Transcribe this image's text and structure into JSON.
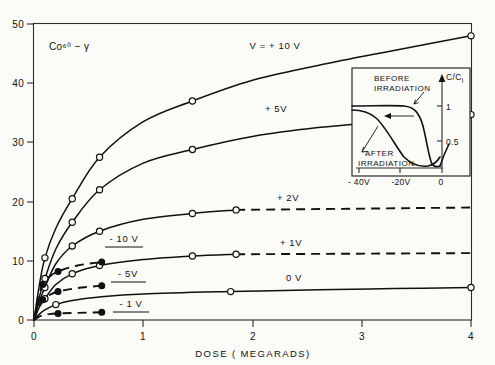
{
  "figure": {
    "sample_label": "Co⁶⁰ − γ",
    "background": "#fbfbf8",
    "ink": "#111111"
  },
  "chart_data": {
    "type": "line",
    "title": "",
    "subtitle": "",
    "annotation_sample": "Co⁶⁰ − γ",
    "xlabel": "DOSE ( MEGARADS)",
    "ylabel": "",
    "xlim": [
      0,
      4
    ],
    "ylim": [
      0,
      50
    ],
    "xticks": [
      0,
      1,
      2,
      3,
      4
    ],
    "xticklabels": [
      "0",
      "1",
      "2",
      "3",
      "4"
    ],
    "yticks": [
      0,
      10,
      20,
      30,
      40,
      50
    ],
    "yticklabels": [
      "0",
      "10",
      "20",
      "30",
      "40",
      "50"
    ],
    "grid": false,
    "legend": "inline curve labels",
    "marker_key": {
      "open_circle": "solid curves (positive / 0 V bias)",
      "filled_circle": "dashed curves (negative bias)"
    },
    "series": [
      {
        "name": "V = + 10 V",
        "label": "V = + 10 V",
        "style": "solid",
        "marker": "open",
        "label_x": 2.4,
        "label_y": 45.0,
        "x": [
          0.0,
          0.05,
          0.1,
          0.2,
          0.35,
          0.6,
          1.0,
          1.45,
          2.0,
          2.6,
          3.2,
          4.0
        ],
        "y": [
          0.0,
          6.0,
          10.5,
          15.5,
          20.5,
          27.5,
          33.5,
          37.0,
          40.5,
          43.0,
          45.2,
          48.0
        ],
        "points_x": [
          0.1,
          0.35,
          0.6,
          1.45,
          4.0
        ],
        "points_y": [
          10.5,
          20.5,
          27.5,
          37.0,
          48.0
        ]
      },
      {
        "name": "+ 5V",
        "label": "+ 5V",
        "style": "solid",
        "marker": "open",
        "label_x": 2.22,
        "label_y": 35.2,
        "x": [
          0.0,
          0.05,
          0.1,
          0.2,
          0.35,
          0.6,
          1.0,
          1.45,
          2.0,
          2.6,
          3.2,
          4.0
        ],
        "y": [
          0.0,
          4.0,
          7.0,
          12.0,
          16.5,
          22.0,
          26.5,
          28.8,
          31.0,
          32.5,
          33.5,
          34.7
        ],
        "points_x": [
          0.1,
          0.35,
          0.6,
          1.45,
          4.0
        ],
        "points_y": [
          7.0,
          16.5,
          22.0,
          28.8,
          34.7
        ]
      },
      {
        "name": "+ 2V",
        "label": "+ 2V",
        "style": "solid-then-dashed",
        "marker": "open",
        "label_x": 2.32,
        "label_y": 20.3,
        "x": [
          0.0,
          0.05,
          0.1,
          0.2,
          0.35,
          0.6,
          1.0,
          1.45,
          1.85
        ],
        "y": [
          0.0,
          3.2,
          5.5,
          9.5,
          12.5,
          15.0,
          17.0,
          18.0,
          18.6
        ],
        "dash_from_x": 1.85,
        "dash_to_x": 4.0,
        "dash_y": 19.0,
        "points_x": [
          0.1,
          0.35,
          0.6,
          1.45,
          1.85
        ],
        "points_y": [
          5.5,
          12.5,
          15.0,
          18.0,
          18.6
        ]
      },
      {
        "name": "+ 1V",
        "label": "+ 1V",
        "style": "solid-then-dashed",
        "marker": "open",
        "label_x": 2.35,
        "label_y": 12.7,
        "x": [
          0.0,
          0.05,
          0.1,
          0.2,
          0.35,
          0.6,
          1.0,
          1.45,
          1.85
        ],
        "y": [
          0.0,
          2.2,
          3.6,
          6.0,
          7.8,
          9.2,
          10.2,
          10.8,
          11.1
        ],
        "dash_from_x": 1.85,
        "dash_to_x": 4.0,
        "dash_y": 11.3,
        "points_x": [
          0.1,
          0.35,
          0.6,
          1.45,
          1.85
        ],
        "points_y": [
          3.6,
          7.8,
          9.2,
          10.8,
          11.1
        ]
      },
      {
        "name": "0 V",
        "label": "0 V",
        "style": "solid",
        "marker": "open",
        "label_x": 2.4,
        "label_y": 6.9,
        "x": [
          0.0,
          0.05,
          0.1,
          0.2,
          0.35,
          0.6,
          1.0,
          1.8,
          2.6,
          3.3,
          4.0
        ],
        "y": [
          0.0,
          1.0,
          1.7,
          2.6,
          3.3,
          3.9,
          4.4,
          4.8,
          5.1,
          5.3,
          5.5
        ],
        "points_x": [
          0.2,
          1.8,
          4.0
        ],
        "points_y": [
          2.6,
          4.8,
          5.5
        ]
      },
      {
        "name": "- 10 V",
        "label": "- 10 V",
        "style": "dashed",
        "marker": "filled",
        "label_x": 0.82,
        "label_y": 13.1,
        "underline": true,
        "x": [
          0.0,
          0.04,
          0.08,
          0.14,
          0.22,
          0.4,
          0.62
        ],
        "y": [
          0.0,
          4.0,
          6.0,
          7.3,
          8.2,
          9.2,
          9.8
        ],
        "points_x": [
          0.08,
          0.22,
          0.62
        ],
        "points_y": [
          6.0,
          8.2,
          9.8
        ]
      },
      {
        "name": "- 5V",
        "label": "- 5V",
        "style": "dashed",
        "marker": "filled",
        "label_x": 0.86,
        "label_y": 7.2,
        "underline": true,
        "x": [
          0.0,
          0.04,
          0.08,
          0.14,
          0.22,
          0.4,
          0.62
        ],
        "y": [
          0.0,
          2.3,
          3.4,
          4.2,
          4.8,
          5.4,
          5.8
        ],
        "points_x": [
          0.08,
          0.22,
          0.62
        ],
        "points_y": [
          3.4,
          4.8,
          5.8
        ]
      },
      {
        "name": "- 1V",
        "label": "- 1 V",
        "style": "dashed",
        "marker": "filled",
        "label_x": 0.88,
        "label_y": 2.3,
        "underline": true,
        "x": [
          0.0,
          0.04,
          0.08,
          0.14,
          0.22,
          0.4,
          0.62
        ],
        "y": [
          0.0,
          0.5,
          0.8,
          1.0,
          1.1,
          1.2,
          1.3
        ],
        "points_x": [
          0.22,
          0.62
        ],
        "points_y": [
          1.1,
          1.3
        ]
      }
    ]
  },
  "inset": {
    "type": "line",
    "ylabel": "C/C",
    "ylabel_sub": "i",
    "yticklabels": [
      "1",
      "0.5"
    ],
    "xticklabels": [
      "- 40V",
      "-20V",
      "0"
    ],
    "annotations": [
      {
        "text_line1": "BEFORE",
        "text_line2": "IRRADIATION"
      },
      {
        "text_line1": "AFTER",
        "text_line2": "IRRADIATION"
      }
    ],
    "curves": [
      {
        "name": "before-irradiation"
      },
      {
        "name": "after-irradiation"
      }
    ]
  }
}
